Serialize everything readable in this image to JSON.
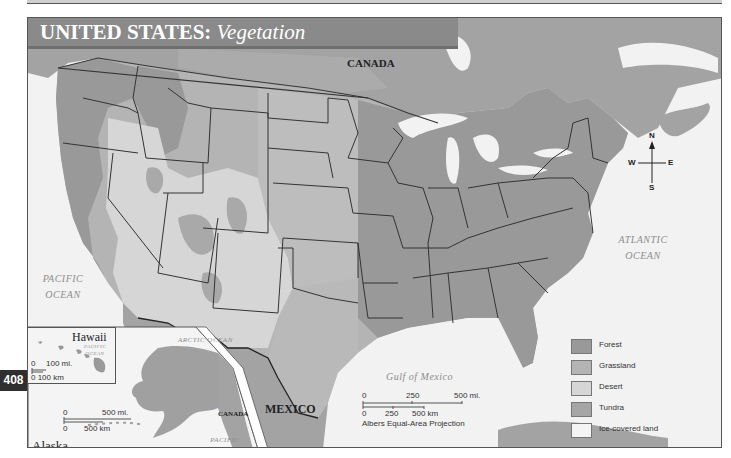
{
  "page": {
    "page_number": "408",
    "title_main": "UNITED STATES:",
    "title_sub": "Vegetation"
  },
  "map": {
    "labels": {
      "canada_north": "CANADA",
      "canada_inset": "CANADA",
      "mexico": "MEXICO",
      "pacific_ocean_line1": "PACIFIC",
      "pacific_ocean_line2": "OCEAN",
      "atlantic_ocean_line1": "ATLANTIC",
      "atlantic_ocean_line2": "OCEAN",
      "gulf_of_mexico": "Gulf of Mexico",
      "arctic_ocean": "ARCTIC OCEAN",
      "alaska_pacific_line1": "PACIFIC",
      "alaska_pacific_line2": "OCEAN",
      "hawaii_pacific_line1": "PACIFIC",
      "hawaii_pacific_line2": "OCEAN"
    },
    "compass": {
      "n": "N",
      "s": "S",
      "e": "E",
      "w": "W"
    },
    "colors": {
      "forest": "#999999",
      "grassland": "#b4b4b4",
      "desert": "#d6d6d6",
      "tundra": "#a6a6a6",
      "ice": "#f4f4f4",
      "water": "#f2f2f2",
      "other_land": "#a3a3a3",
      "title_bar": "#8a8a8a",
      "page_tab": "#2f2f2f"
    }
  },
  "main_scale": {
    "miles_ticks": [
      "0",
      "250",
      "500 mi."
    ],
    "km_ticks": [
      "0",
      "250",
      "500 km"
    ],
    "projection": "Albers Equal-Area Projection"
  },
  "insets": {
    "hawaii": {
      "title": "Hawaii",
      "scale_mi": "100 mi.",
      "scale_mi_zero": "0",
      "scale_km": "0  100 km"
    },
    "alaska": {
      "title": "Alaska",
      "scale_mi_zero": "0",
      "scale_mi": "500 mi.",
      "scale_km_zero": "0",
      "scale_km": "500 km"
    }
  },
  "legend": {
    "items": [
      {
        "label": "Forest",
        "color": "#999999"
      },
      {
        "label": "Grassland",
        "color": "#b4b4b4"
      },
      {
        "label": "Desert",
        "color": "#d6d6d6"
      },
      {
        "label": "Tundra",
        "color": "#a6a6a6"
      },
      {
        "label": "Ice-covered land",
        "color": "#f4f4f4"
      }
    ]
  }
}
